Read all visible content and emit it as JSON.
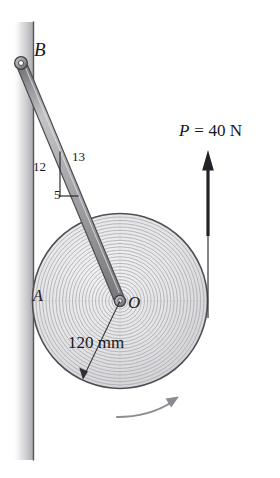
{
  "figure": {
    "background_color": "#ffffff",
    "width": 280,
    "height": 478
  },
  "labels": {
    "point_B": "B",
    "point_A": "A",
    "point_O": "O",
    "slope_vertical": "12",
    "slope_hypotenuse": "13",
    "slope_horizontal": "5",
    "radius_dimension": "120 mm",
    "force_symbol": "P",
    "force_equals": "=",
    "force_value": "40 N"
  },
  "colors": {
    "outline": "#3a3a3e",
    "wall_line": "#6d6d72",
    "wall_shadow": "#b9b9bc",
    "bar_fill": "#b0b0b2",
    "bar_edge": "#5a5a5f",
    "spool_fill": "#e6e6e8",
    "spool_edge": "#58585d",
    "winding": "#b5b5ba",
    "cable": "#2f2f33",
    "arrow": "#2b2b2f",
    "rotation_arrow": "#8e8e93",
    "text": "#17171a"
  },
  "geometry": {
    "spool": {
      "center_x": 120,
      "center_y": 301,
      "radius_px": 88,
      "radius_label_mm": 120,
      "winding_rings": 26
    },
    "bar": {
      "from_x": 21,
      "from_y": 63,
      "to_x": 120,
      "to_y": 301,
      "half_width_px": 5
    },
    "wall": {
      "x": 33,
      "top_y": 22,
      "bottom_y": 460
    },
    "slope_triangle": {
      "apex_x": 60,
      "apex_y": 152,
      "vertical_run": 12,
      "horizontal_run": 5,
      "hypotenuse": 13
    },
    "force_cable": {
      "x": 208,
      "tip_y": 152,
      "tangent_y": 301,
      "end_y": 318,
      "direction": "up"
    },
    "rotation_arrow": {
      "from_x": 119,
      "from_y": 416,
      "to_x": 176,
      "to_y": 400,
      "sense": "clockwise"
    },
    "dimension_line": {
      "from_x": 120,
      "from_y": 301,
      "to_x": 82,
      "to_y": 380
    }
  },
  "icon_names": {
    "force_arrow": "up-arrow-icon",
    "rotation_arrow": "curved-arrow-icon",
    "pin_B": "pin-joint-icon",
    "pin_O": "pin-joint-icon",
    "dimension_arrow": "dimension-arrow-icon"
  }
}
